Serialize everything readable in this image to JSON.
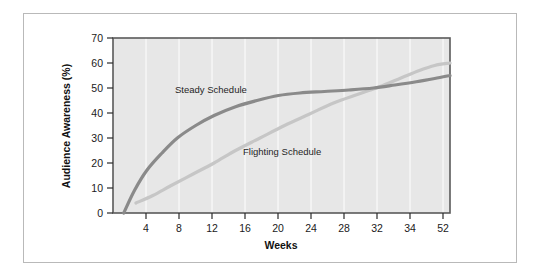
{
  "figure": {
    "background_color": "#ffffff",
    "frame_color": "#b9b9b9",
    "plot_background_color": "#e7e7e7",
    "plot_border_color": "#5a5a5a",
    "gridline_color": "#f4f4f4"
  },
  "chart_data": {
    "type": "line",
    "title": "",
    "subtitle": "",
    "xlabel": "Weeks",
    "ylabel": "Audience Awareness (%)",
    "x_tick_labels": [
      "4",
      "8",
      "12",
      "16",
      "20",
      "24",
      "28",
      "32",
      "34",
      "52"
    ],
    "x_tick_values": [
      4,
      8,
      12,
      16,
      20,
      24,
      28,
      32,
      34,
      52
    ],
    "y_tick_labels": [
      "0",
      "10",
      "20",
      "30",
      "40",
      "50",
      "60",
      "70"
    ],
    "y_tick_values": [
      0,
      10,
      20,
      30,
      40,
      50,
      60,
      70
    ],
    "ylim": [
      0,
      70
    ],
    "xlim": [
      0,
      11
    ],
    "x_axis_note": "Category axis: ticks evenly spaced, week values non-linear at end (34 then 52)",
    "grid": "vertical-only-faint",
    "legend": "inline-labels",
    "legend_position": "inline",
    "series": [
      {
        "name": "Steady Schedule",
        "color": "#8a8a8a",
        "line_width": 3.2,
        "label_text": "Steady Schedule",
        "points": [
          {
            "x": 0.35,
            "y": 0
          },
          {
            "x": 0.7,
            "y": 9
          },
          {
            "x": 1.1,
            "y": 17
          },
          {
            "x": 1.6,
            "y": 24
          },
          {
            "x": 2.1,
            "y": 30
          },
          {
            "x": 2.7,
            "y": 35
          },
          {
            "x": 3.3,
            "y": 39
          },
          {
            "x": 4.0,
            "y": 42.5
          },
          {
            "x": 4.7,
            "y": 45
          },
          {
            "x": 5.4,
            "y": 47
          },
          {
            "x": 6.1,
            "y": 48
          },
          {
            "x": 6.9,
            "y": 48.6
          },
          {
            "x": 7.7,
            "y": 49.2
          },
          {
            "x": 8.5,
            "y": 50
          },
          {
            "x": 9.2,
            "y": 51.2
          },
          {
            "x": 9.9,
            "y": 52.5
          },
          {
            "x": 10.5,
            "y": 53.8
          },
          {
            "x": 11.0,
            "y": 55
          }
        ]
      },
      {
        "name": "Flighting Schedule",
        "color": "#c6c6c6",
        "line_width": 3.2,
        "label_text": "Flighting Schedule",
        "points": [
          {
            "x": 0.75,
            "y": 4
          },
          {
            "x": 1.3,
            "y": 7
          },
          {
            "x": 1.9,
            "y": 11
          },
          {
            "x": 2.6,
            "y": 15.5
          },
          {
            "x": 3.3,
            "y": 20
          },
          {
            "x": 4.0,
            "y": 25
          },
          {
            "x": 4.8,
            "y": 30
          },
          {
            "x": 5.6,
            "y": 35
          },
          {
            "x": 6.4,
            "y": 39.5
          },
          {
            "x": 7.2,
            "y": 44
          },
          {
            "x": 8.0,
            "y": 47.5
          },
          {
            "x": 8.7,
            "y": 50.5
          },
          {
            "x": 9.4,
            "y": 54
          },
          {
            "x": 10.0,
            "y": 57
          },
          {
            "x": 10.5,
            "y": 59
          },
          {
            "x": 11.0,
            "y": 60
          }
        ]
      }
    ],
    "annotations": [
      {
        "text": "Steady Schedule",
        "x_px": 175,
        "y_px": 93
      },
      {
        "text": "Flighting Schedule",
        "x_px": 243,
        "y_px": 155
      }
    ]
  }
}
